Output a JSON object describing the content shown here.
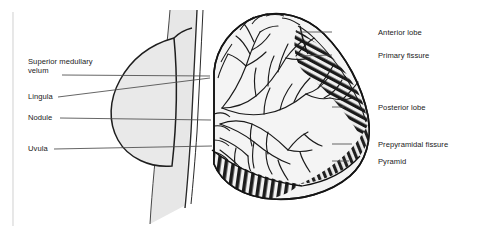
{
  "figure": {
    "type": "anatomical-line-diagram",
    "background_color": "#ffffff",
    "ink_color": "#1a1a1a",
    "tissue_fill_color": "#e6e6e6",
    "folia_dark_color": "#1c1c1c",
    "frame": {
      "left_border_color": "#d8d8d8",
      "left_border_x": 13,
      "left_border_top": 12,
      "left_border_bottom": 226
    }
  },
  "labels_left": [
    {
      "id": "superior-medullary-velum",
      "text_line1": "Superior medullary",
      "text_line2": "velum",
      "text": "Superior medullary velum",
      "x": 28,
      "y": 57,
      "leader_from_x": 62,
      "leader_from_y": 75,
      "leader_to_x": 210,
      "leader_to_y": 76,
      "multiline": true
    },
    {
      "id": "lingula",
      "text": "Lingula",
      "x": 28,
      "y": 92,
      "leader_from_x": 58,
      "leader_from_y": 97,
      "leader_to_x": 210,
      "leader_to_y": 78,
      "multiline": false
    },
    {
      "id": "nodule",
      "text": "Nodule",
      "x": 28,
      "y": 113,
      "leader_from_x": 60,
      "leader_from_y": 118,
      "leader_to_x": 211,
      "leader_to_y": 120,
      "multiline": false
    },
    {
      "id": "uvula",
      "text": "Uvula",
      "x": 28,
      "y": 144,
      "leader_from_x": 54,
      "leader_from_y": 149,
      "leader_to_x": 212,
      "leader_to_y": 146,
      "multiline": false
    }
  ],
  "labels_right": [
    {
      "id": "anterior-lobe",
      "text": "Anterior lobe",
      "x": 378,
      "y": 28,
      "leader_from_x": 332,
      "leader_from_y": 32,
      "leader_to_x": 296,
      "leader_to_y": 32
    },
    {
      "id": "primary-fissure",
      "text": "Primary fissure",
      "x": 378,
      "y": 51,
      "leader_from_x": 332,
      "leader_from_y": 55,
      "leader_to_x": 300,
      "leader_to_y": 56
    },
    {
      "id": "posterior-lobe",
      "text": "Posterior lobe",
      "x": 378,
      "y": 103,
      "leader_from_x": 332,
      "leader_from_y": 107,
      "leader_to_x": 344,
      "leader_to_y": 107
    },
    {
      "id": "prepyramidal-fissure",
      "text": "Prepyramidal fissure",
      "x": 378,
      "y": 140,
      "leader_from_x": 332,
      "leader_from_y": 144,
      "leader_to_x": 352,
      "leader_to_y": 144
    },
    {
      "id": "pyramid",
      "text": "Pyramid",
      "x": 378,
      "y": 157,
      "leader_from_x": 332,
      "leader_from_y": 161,
      "leader_to_x": 349,
      "leader_to_y": 161
    }
  ],
  "structures": [
    {
      "id": "brainstem",
      "name": "brainstem-band",
      "description": "vertical light grey band"
    },
    {
      "id": "pons-bulge",
      "name": "pons-bulge",
      "description": "rounded lobe bulging left of brainstem"
    },
    {
      "id": "arbor-vitae",
      "name": "arbor-vitae",
      "description": "branching white matter tree in cerebellum"
    },
    {
      "id": "cerebellar-cortex",
      "name": "cerebellar-cortex",
      "description": "folded outer cortex"
    },
    {
      "id": "folia",
      "name": "inferior-folia",
      "description": "dark striated inferior folia bands"
    }
  ]
}
